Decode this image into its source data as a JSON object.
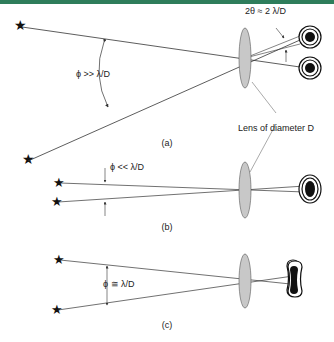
{
  "colors": {
    "top_bar": "#2e7d5b",
    "line": "#333333",
    "lens_fill": "#c8c8c8",
    "spot": "#111111"
  },
  "panels": [
    {
      "id": "a",
      "caption": "(a)",
      "angle_label": "ϕ >> λ/D",
      "extra_label": "2θ ≈ 2 λ/D"
    },
    {
      "id": "b",
      "caption": "(b)",
      "angle_label": "ϕ << λ/D"
    },
    {
      "id": "c",
      "caption": "(c)",
      "angle_label": "ϕ ≅ λ/D"
    }
  ],
  "lens_label": "Lens of diameter D",
  "icons": {
    "source": "star-icon",
    "image": "airy-pattern-icon",
    "lens": "lens-icon"
  }
}
